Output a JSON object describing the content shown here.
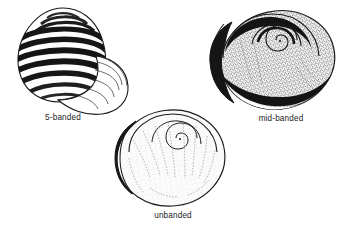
{
  "figure": {
    "background_color": "#ffffff",
    "width": 343,
    "height": 232,
    "ink_color": "#1a1a1a",
    "band_color": "#141414",
    "stipple_color": "#555555",
    "shell_fill": "#fafafa"
  },
  "specimens": [
    {
      "id": "five-banded",
      "label": "5-banded",
      "pattern": "five dark spiral bands alternating with pale bands",
      "band_count": 5,
      "aperture": "open, lower-right, pale with curved inner growth lines",
      "label_x": 63,
      "label_y": 113
    },
    {
      "id": "mid-banded",
      "label": "mid-banded",
      "pattern": "stippled ground with a single broad dark mid-whorl band",
      "band_count": 1,
      "aperture": "dark shadowed lip, left side",
      "label_x": 281,
      "label_y": 114
    },
    {
      "id": "unbanded",
      "label": "unbanded",
      "pattern": "pale stippled shell with no dark spiral bands, growth lines only",
      "band_count": 0,
      "aperture": "dark crescent shadow along left outer lip",
      "label_x": 173,
      "label_y": 211
    }
  ]
}
